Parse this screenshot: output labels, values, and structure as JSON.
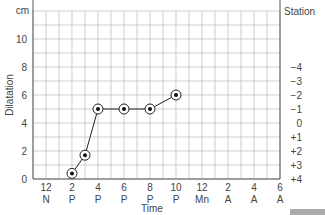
{
  "chart_data": {
    "type": "line",
    "title": "",
    "xlabel": "Time",
    "ylabel": "Dilatation",
    "y_unit": "cm",
    "right_axis_label": "Station",
    "ylim": [
      0,
      12
    ],
    "y_ticks": [
      0,
      2,
      4,
      6,
      8,
      10
    ],
    "x_ticks": [
      {
        "top": "12",
        "bottom": "N"
      },
      {
        "top": "2",
        "bottom": "P"
      },
      {
        "top": "4",
        "bottom": "P"
      },
      {
        "top": "6",
        "bottom": "P"
      },
      {
        "top": "8",
        "bottom": "P"
      },
      {
        "top": "10",
        "bottom": "P"
      },
      {
        "top": "12",
        "bottom": "Mn"
      },
      {
        "top": "2",
        "bottom": "A"
      },
      {
        "top": "4",
        "bottom": "A"
      },
      {
        "top": "6",
        "bottom": "A"
      }
    ],
    "station_ticks": [
      {
        "label": "−4",
        "y": 4
      },
      {
        "label": "−3",
        "y": 5
      },
      {
        "label": "−2",
        "y": 6
      },
      {
        "label": "−1",
        "y": 7
      },
      {
        "label": "0",
        "y": 8
      },
      {
        "label": "+1",
        "y": 9
      },
      {
        "label": "+2",
        "y": 10
      },
      {
        "label": "+3",
        "y": 11
      },
      {
        "label": "+4",
        "y": 12
      }
    ],
    "grid": true,
    "series": [
      {
        "name": "Dilatation",
        "points": [
          {
            "time": "2 P",
            "x_hours": 2,
            "value": 0.4
          },
          {
            "time": "3 P",
            "x_hours": 3,
            "value": 1.7
          },
          {
            "time": "4 P",
            "x_hours": 4,
            "value": 5
          },
          {
            "time": "6 P",
            "x_hours": 6,
            "value": 5
          },
          {
            "time": "8 P",
            "x_hours": 8,
            "value": 5
          },
          {
            "time": "10 P",
            "x_hours": 10,
            "value": 6
          }
        ]
      }
    ]
  }
}
